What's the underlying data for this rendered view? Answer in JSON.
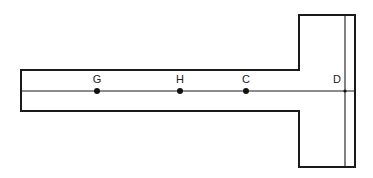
{
  "figure": {
    "type": "T-shaped beam (plan view)",
    "colors": {
      "line": "#1a1a1a",
      "point": "#111111",
      "background": "#ffffff"
    },
    "geometry": {
      "bar": {
        "left": 21,
        "top": 70,
        "bottom": 111,
        "right": 299
      },
      "flange": {
        "left": 299,
        "right": 355,
        "top": 15,
        "bottom": 167
      },
      "inner_line_x": 345,
      "centerline_y": 91
    },
    "points": [
      {
        "label": "G",
        "x": 97,
        "y": 91
      },
      {
        "label": "H",
        "x": 180,
        "y": 91
      },
      {
        "label": "C",
        "x": 246,
        "y": 91
      },
      {
        "label": "D",
        "x": 345,
        "y": 91
      }
    ]
  }
}
